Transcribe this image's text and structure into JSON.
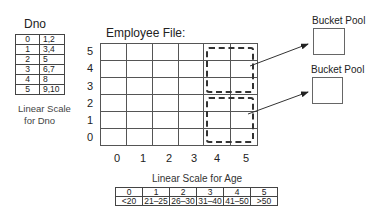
{
  "dno_scale": {
    "title": "Dno",
    "rows": [
      {
        "index": "0",
        "values": "1,2"
      },
      {
        "index": "1",
        "values": "3,4"
      },
      {
        "index": "2",
        "values": "5"
      },
      {
        "index": "3",
        "values": "6,7"
      },
      {
        "index": "4",
        "values": "8"
      },
      {
        "index": "5",
        "values": "9,10"
      }
    ],
    "caption_line1": "Linear Scale",
    "caption_line2": "for Dno"
  },
  "grid": {
    "title": "Employee File:",
    "rows": 6,
    "cols": 6,
    "y_labels": [
      "5",
      "4",
      "3",
      "2",
      "1",
      "0"
    ],
    "x_labels": [
      "0",
      "1",
      "2",
      "3",
      "4",
      "5"
    ]
  },
  "buckets": [
    {
      "label": "Bucket Pool"
    },
    {
      "label": "Bucket Pool"
    }
  ],
  "age_scale": {
    "title": "Linear Scale for Age",
    "indices": [
      "0",
      "1",
      "2",
      "3",
      "4",
      "5"
    ],
    "ranges": [
      "<20",
      "21–25",
      "26–30",
      "31–40",
      "41–50",
      ">50"
    ]
  }
}
